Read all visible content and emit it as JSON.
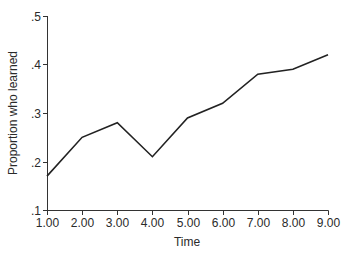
{
  "chart_data": {
    "type": "line",
    "title": "",
    "xlabel": "Time",
    "ylabel": "Proportion who learned",
    "x": [
      1.0,
      2.0,
      3.0,
      4.0,
      5.0,
      6.0,
      7.0,
      8.0,
      9.0
    ],
    "x_tick_labels": [
      "1.00",
      "2.00",
      "3.00",
      "4.00",
      "5.00",
      "6.00",
      "7.00",
      "8.00",
      "9.00"
    ],
    "series": [
      {
        "name": "Proportion who learned",
        "values": [
          0.17,
          0.25,
          0.28,
          0.21,
          0.29,
          0.32,
          0.38,
          0.39,
          0.42
        ],
        "color": "#222222"
      }
    ],
    "y_ticks": [
      0.1,
      0.2,
      0.3,
      0.4,
      0.5
    ],
    "y_tick_labels": [
      ".1",
      ".2",
      ".3",
      ".4",
      ".5"
    ],
    "xlim": [
      1,
      9
    ],
    "ylim": [
      0.1,
      0.5
    ],
    "grid": false,
    "legend": "none"
  }
}
